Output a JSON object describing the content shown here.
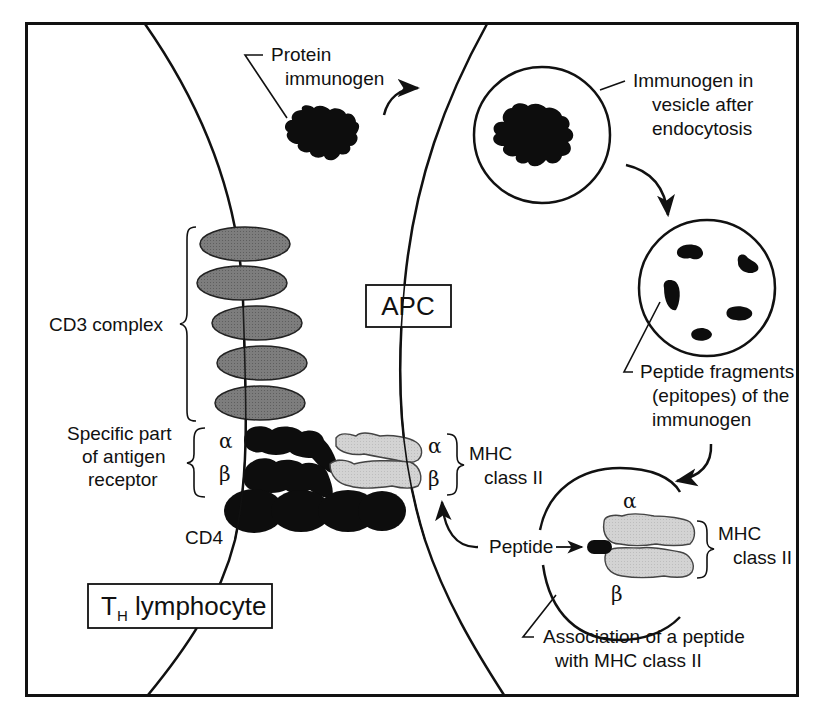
{
  "figure": {
    "colors": {
      "frame": "#111111",
      "cd3_fill": "#7a7a7a",
      "receptor_fill": "#0d0d0d",
      "mhc_fill": "#d2d2d2",
      "mhc_stroke": "#444444",
      "background": "#ffffff"
    },
    "cells": {
      "apc_label": "APC",
      "th_label_main": "T",
      "th_label_sub": "H",
      "th_label_rest": " lymphocyte"
    },
    "labels": {
      "protein_immunogen": [
        "Protein",
        "immunogen"
      ],
      "immunogen_vesicle": [
        "Immunogen in",
        "vesicle after",
        "endocytosis"
      ],
      "peptide_fragments": [
        "Peptide fragments",
        "(epitopes) of the",
        "immunogen"
      ],
      "cd3_complex": "CD3 complex",
      "antigen_receptor": [
        "Specific part",
        "of antigen",
        "receptor"
      ],
      "cd4": "CD4",
      "alpha": "α",
      "beta": "β",
      "mhc_class_ii": [
        "MHC",
        "class II"
      ],
      "peptide": "Peptide",
      "association": [
        "Association of a peptide",
        "with MHC class II"
      ]
    },
    "components": {
      "cd3_subunit_count": 5,
      "cd4_domain_count": 4,
      "peptide_fragment_count": 5
    }
  }
}
